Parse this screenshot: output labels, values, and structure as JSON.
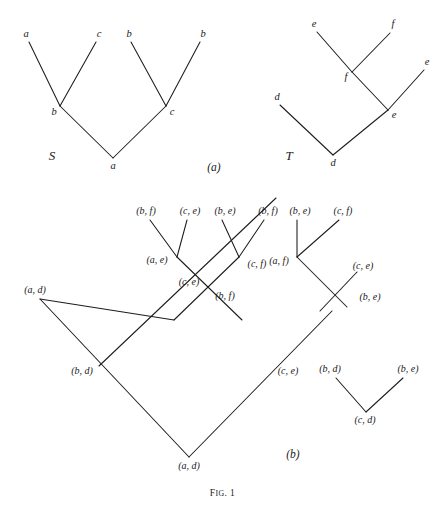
{
  "figure": {
    "caption_prefix": "F",
    "caption_smallcaps": "IG",
    "caption_suffix": ". 1",
    "caption_full": "Fig. 1",
    "width": 445,
    "height": 508,
    "ink_color": "#1c1c1c",
    "background_color": "#ffffff"
  },
  "panels": {
    "a": {
      "label": "(a)",
      "x": 214,
      "y": 168
    },
    "b": {
      "label": "(b)",
      "x": 293,
      "y": 455
    }
  },
  "tree_s": {
    "name": "S",
    "name_x": 52,
    "name_y": 155,
    "nodes": [
      {
        "id": "s-leaf-a1",
        "label": "a",
        "x": 26,
        "y": 34,
        "tip_x": 29,
        "tip_y": 42
      },
      {
        "id": "s-leaf-c",
        "label": "c",
        "x": 99,
        "y": 34,
        "tip_x": 96,
        "tip_y": 42
      },
      {
        "id": "s-leaf-b1",
        "label": "b",
        "x": 129,
        "y": 34,
        "tip_x": 131,
        "tip_y": 42
      },
      {
        "id": "s-leaf-b2",
        "label": "b",
        "x": 203,
        "y": 34,
        "tip_x": 200,
        "tip_y": 42
      },
      {
        "id": "s-int-b",
        "label": "b",
        "x": 54,
        "y": 112,
        "tip_x": 60,
        "tip_y": 106
      },
      {
        "id": "s-int-c",
        "label": "c",
        "x": 172,
        "y": 112,
        "tip_x": 166,
        "tip_y": 106
      },
      {
        "id": "s-root-a",
        "label": "a",
        "x": 113,
        "y": 166,
        "tip_x": 113,
        "tip_y": 158
      }
    ],
    "edges": [
      {
        "from": "a-leaf",
        "x1": 29,
        "y1": 42,
        "x2": 60,
        "y2": 106
      },
      {
        "from": "c-leaf",
        "x1": 96,
        "y1": 42,
        "x2": 60,
        "y2": 106
      },
      {
        "from": "b-int",
        "x1": 60,
        "y1": 106,
        "x2": 113,
        "y2": 158
      },
      {
        "from": "b-leaf",
        "x1": 131,
        "y1": 42,
        "x2": 166,
        "y2": 106
      },
      {
        "from": "b-leaf2",
        "x1": 200,
        "y1": 42,
        "x2": 166,
        "y2": 106
      },
      {
        "from": "c-int",
        "x1": 166,
        "y1": 106,
        "x2": 113,
        "y2": 158
      }
    ]
  },
  "tree_t": {
    "name": "T",
    "name_x": 289,
    "name_y": 155,
    "nodes": [
      {
        "id": "t-leaf-e1",
        "label": "e",
        "x": 314,
        "y": 24,
        "tip_x": 317,
        "tip_y": 32
      },
      {
        "id": "t-leaf-f",
        "label": "f",
        "x": 393,
        "y": 24,
        "tip_x": 390,
        "tip_y": 33
      },
      {
        "id": "t-int-f",
        "label": "f",
        "x": 346,
        "y": 77,
        "tip_x": 352,
        "tip_y": 72
      },
      {
        "id": "t-leaf-e2",
        "label": "e",
        "x": 427,
        "y": 62,
        "tip_x": 424,
        "tip_y": 70
      },
      {
        "id": "t-int-e",
        "label": "e",
        "x": 394,
        "y": 115,
        "tip_x": 388,
        "tip_y": 110
      },
      {
        "id": "t-leaf-d",
        "label": "d",
        "x": 277,
        "y": 97,
        "tip_x": 280,
        "tip_y": 105
      },
      {
        "id": "t-root-d",
        "label": "d",
        "x": 333,
        "y": 163,
        "tip_x": 333,
        "tip_y": 155
      }
    ],
    "edges": [
      {
        "x1": 317,
        "y1": 32,
        "x2": 352,
        "y2": 72
      },
      {
        "x1": 390,
        "y1": 33,
        "x2": 352,
        "y2": 72
      },
      {
        "x1": 352,
        "y1": 72,
        "x2": 388,
        "y2": 110
      },
      {
        "x1": 424,
        "y1": 70,
        "x2": 388,
        "y2": 110
      },
      {
        "x1": 388,
        "y1": 110,
        "x2": 333,
        "y2": 155
      },
      {
        "x1": 280,
        "y1": 105,
        "x2": 333,
        "y2": 155
      }
    ]
  },
  "product_graph": {
    "nodes": [
      {
        "id": "p-bf-1",
        "label": "(b, f)",
        "x": 146,
        "y": 211,
        "tip_x": 150,
        "tip_y": 220
      },
      {
        "id": "p-ce-1",
        "label": "(c, e)",
        "x": 190,
        "y": 211,
        "tip_x": 187,
        "tip_y": 220
      },
      {
        "id": "p-be-1",
        "label": "(b, e)",
        "x": 225,
        "y": 211,
        "tip_x": 222,
        "tip_y": 220
      },
      {
        "id": "p-bf-2",
        "label": "(b, f)",
        "x": 268,
        "y": 211,
        "tip_x": 264,
        "tip_y": 220
      },
      {
        "id": "p-be-2",
        "label": "(b, e)",
        "x": 300,
        "y": 211,
        "tip_x": 297,
        "tip_y": 220
      },
      {
        "id": "p-cf-2",
        "label": "(c, f)",
        "x": 343,
        "y": 211,
        "tip_x": 339,
        "tip_y": 220
      },
      {
        "id": "p-ae",
        "label": "(a, e)",
        "x": 157,
        "y": 260,
        "tip_x": 177,
        "tip_y": 257
      },
      {
        "id": "p-cf-1",
        "label": "(c, f)",
        "x": 257,
        "y": 264,
        "tip_x": 239,
        "tip_y": 257
      },
      {
        "id": "p-af",
        "label": "(a, f)",
        "x": 279,
        "y": 261,
        "tip_x": 297,
        "tip_y": 257
      },
      {
        "id": "p-ce-2",
        "label": "(c, e)",
        "x": 189,
        "y": 282,
        "tip_x": 203,
        "tip_y": 288
      },
      {
        "id": "p-bf-3",
        "label": "(b, f)",
        "x": 225,
        "y": 296,
        "tip_x": 209,
        "tip_y": 289
      },
      {
        "id": "p-ce-3",
        "label": "(c, e)",
        "x": 363,
        "y": 266,
        "tip_x": 357,
        "tip_y": 273
      },
      {
        "id": "p-be-3",
        "label": "(b, e)",
        "x": 370,
        "y": 297,
        "tip_x": 348,
        "tip_y": 292
      },
      {
        "id": "p-ad-1",
        "label": "(a, d)",
        "x": 35,
        "y": 290,
        "tip_x": 40,
        "tip_y": 299
      },
      {
        "id": "p-bd",
        "label": "(b, d)",
        "x": 82,
        "y": 371,
        "tip_x": 99,
        "tip_y": 366
      },
      {
        "id": "p-ce-4",
        "label": "(c, e)",
        "x": 288,
        "y": 371,
        "tip_x": 275,
        "tip_y": 367
      },
      {
        "id": "p-ad-2",
        "label": "(a, d)",
        "x": 189,
        "y": 466,
        "tip_x": 189,
        "tip_y": 457
      },
      {
        "id": "p-bd-2",
        "label": "(b, d)",
        "x": 330,
        "y": 369,
        "tip_x": 336,
        "tip_y": 378
      },
      {
        "id": "p-be-4",
        "label": "(b, e)",
        "x": 408,
        "y": 369,
        "tip_x": 403,
        "tip_y": 378
      },
      {
        "id": "p-cd",
        "label": "(c, d)",
        "x": 365,
        "y": 420,
        "tip_x": 366,
        "tip_y": 412
      }
    ],
    "edges": [
      {
        "x1": 150,
        "y1": 220,
        "x2": 177,
        "y2": 257
      },
      {
        "x1": 187,
        "y1": 220,
        "x2": 177,
        "y2": 257
      },
      {
        "x1": 177,
        "y1": 257,
        "x2": 240,
        "y2": 318
      },
      {
        "x1": 222,
        "y1": 220,
        "x2": 239,
        "y2": 257
      },
      {
        "x1": 264,
        "y1": 220,
        "x2": 239,
        "y2": 257
      },
      {
        "x1": 239,
        "y1": 257,
        "x2": 176,
        "y2": 318
      },
      {
        "x1": 297,
        "y1": 220,
        "x2": 297,
        "y2": 257
      },
      {
        "x1": 339,
        "y1": 220,
        "x2": 297,
        "y2": 257
      },
      {
        "x1": 297,
        "y1": 257,
        "x2": 345,
        "y2": 305
      },
      {
        "x1": 357,
        "y1": 273,
        "x2": 321,
        "y2": 310
      },
      {
        "x1": 176,
        "y1": 318,
        "x2": 40,
        "y2": 299
      },
      {
        "x1": 40,
        "y1": 299,
        "x2": 189,
        "y2": 457
      },
      {
        "x1": 99,
        "y1": 366,
        "x2": 275,
        "y2": 200
      },
      {
        "x1": 189,
        "y1": 457,
        "x2": 330,
        "y2": 311
      },
      {
        "x1": 336,
        "y1": 378,
        "x2": 366,
        "y2": 412
      },
      {
        "x1": 403,
        "y1": 378,
        "x2": 366,
        "y2": 412
      }
    ]
  }
}
